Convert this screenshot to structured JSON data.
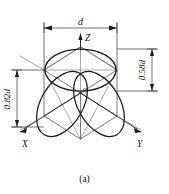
{
  "figure": {
    "caption": "(a)",
    "title_alt": "Isometric projection of a sphere inscribed in a cube",
    "background_color": "#ffffff",
    "line_color": "#1a1a1a",
    "construction_line_color": "#6b6b6b"
  },
  "dimensions": {
    "width_label": "d",
    "height_right_label": "0.58d",
    "height_left_label": "0.82d"
  },
  "axes": {
    "z_label": "Z",
    "x_label": "X",
    "y_label": "Y",
    "origin_label": "O"
  }
}
